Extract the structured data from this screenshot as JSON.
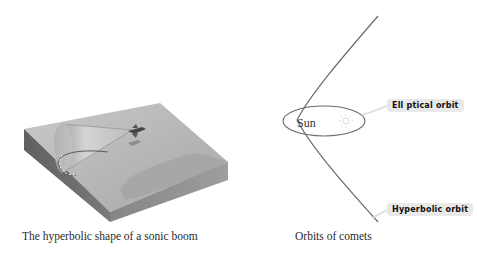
{
  "figures": [
    {
      "id": "sonic-boom",
      "caption": "The hyperbolic shape of a sonic boom",
      "elements": [
        "terrain-block",
        "shock-cone",
        "jet-aircraft",
        "aircraft-shadow",
        "hyperbola-ground-trace"
      ]
    },
    {
      "id": "comet-orbits",
      "caption": "Orbits of comets",
      "center_label": "Sun",
      "labels": {
        "elliptical": "Ell ptical orbit",
        "hyperbolic": "Hyperbolic orbit"
      }
    }
  ],
  "colors": {
    "block_top": "#b9b9b9",
    "block_left_side": "#6e6e6e",
    "block_front_side": "#8e8e8e",
    "curve_stroke": "#6a6a6a",
    "label_bg": "#e9e9e9",
    "sun_glyph": "#dddddd"
  }
}
